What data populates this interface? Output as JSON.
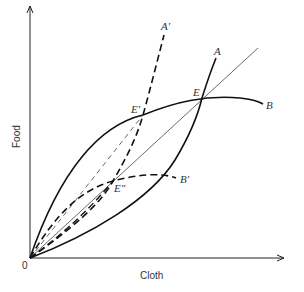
{
  "diagram": {
    "type": "offer-curve trade diagram",
    "axes": {
      "x_label": "Cloth",
      "y_label": "Food",
      "origin_label": "0"
    },
    "curves": [
      {
        "id": "A",
        "label": "A",
        "style": "solid",
        "description": "offer curve of country A"
      },
      {
        "id": "B",
        "label": "B",
        "style": "solid",
        "description": "offer curve of country B"
      },
      {
        "id": "A_prime",
        "label": "A'",
        "style": "dashed",
        "description": "shifted offer curve A'"
      },
      {
        "id": "B_prime",
        "label": "B'",
        "style": "dashed",
        "description": "shifted offer curve B'"
      },
      {
        "id": "ray",
        "label": "",
        "style": "thin solid",
        "description": "terms-of-trade ray from origin through E"
      }
    ],
    "points": [
      {
        "id": "E",
        "label": "E",
        "description": "intersection of A and B"
      },
      {
        "id": "E_prime",
        "label": "E'",
        "description": "intersection of A' and B"
      },
      {
        "id": "E_double_prime",
        "label": "E\"",
        "description": "intersection of A and B'"
      }
    ],
    "colors": {
      "line": "#111111",
      "thin_line": "#444444",
      "text": "#333333",
      "background": "#ffffff"
    }
  }
}
